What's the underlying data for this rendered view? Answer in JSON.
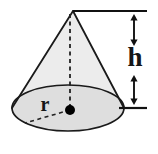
{
  "figure": {
    "name": "cone-geometry-diagram",
    "type": "geometric-solid-diagram",
    "shape": "cone",
    "background_color": "#ffffff",
    "labels": {
      "height_label": "h",
      "radius_label": "r"
    },
    "colors": {
      "outline": "#1a1a1a",
      "cone_fill": "#ececec",
      "base_fill": "#dedede",
      "dash_stroke": "#222222",
      "dimension_stroke": "#111111",
      "center_dot": "#000000",
      "label_color": "#161616"
    },
    "geometry": {
      "apex": {
        "x": 73,
        "y": 11
      },
      "base_ellipse": {
        "cx": 68,
        "cy": 108,
        "rx": 56,
        "ry": 23
      },
      "center_dot": {
        "cx": 70,
        "cy": 110,
        "r": 5
      },
      "radius_endpoint": {
        "x": 25,
        "y": 123
      },
      "top_reference_line": {
        "x1": 73,
        "y1": 11,
        "x2": 147,
        "y2": 11
      },
      "bottom_reference_line": {
        "x1": 119,
        "y1": 108,
        "x2": 147,
        "y2": 108
      },
      "dimension_axis_x": 134,
      "upper_arrow": {
        "y1": 14,
        "y2": 46
      },
      "lower_arrow": {
        "y1": 75,
        "y2": 105
      },
      "height_label_pos": {
        "x": 135,
        "y": 66
      },
      "radius_label_pos": {
        "x": 45,
        "y": 111
      }
    }
  }
}
